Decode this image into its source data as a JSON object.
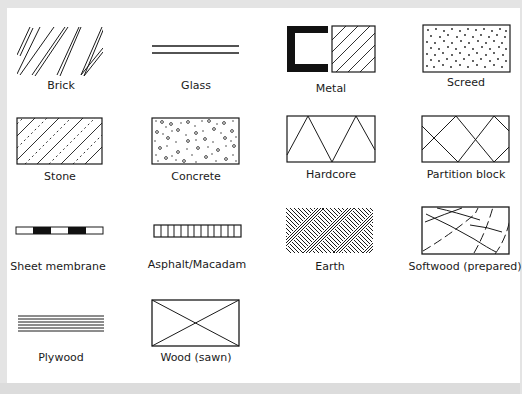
{
  "figure": {
    "symbols": [
      {
        "id": "brick",
        "label": "Brick"
      },
      {
        "id": "glass",
        "label": "Glass"
      },
      {
        "id": "metal",
        "label": "Metal"
      },
      {
        "id": "screed",
        "label": "Screed"
      },
      {
        "id": "stone",
        "label": "Stone"
      },
      {
        "id": "concrete",
        "label": "Concrete"
      },
      {
        "id": "hardcore",
        "label": "Hardcore"
      },
      {
        "id": "partition-block",
        "label": "Partition block"
      },
      {
        "id": "sheet-membrane",
        "label": "Sheet membrane"
      },
      {
        "id": "asphalt-macadam",
        "label": "Asphalt/Macadam"
      },
      {
        "id": "earth",
        "label": "Earth"
      },
      {
        "id": "softwood-prepared",
        "label": "Softwood (prepared)"
      },
      {
        "id": "plywood",
        "label": "Plywood"
      },
      {
        "id": "wood-sawn",
        "label": "Wood (sawn)"
      }
    ]
  },
  "colors": {
    "frame": "#e4e4e4",
    "panel": "#ffffff",
    "ink": "#1a1a1a"
  }
}
